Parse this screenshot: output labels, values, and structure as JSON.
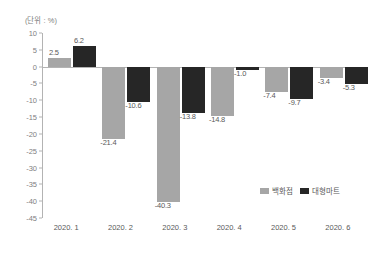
{
  "chart_data": {
    "type": "bar",
    "title": "",
    "subtitle": "",
    "unit_label": "(단위 : %)",
    "xlabel": "",
    "ylabel": "",
    "categories": [
      "2020. 1",
      "2020. 2",
      "2020. 3",
      "2020. 4",
      "2020. 5",
      "2020. 6"
    ],
    "series": [
      {
        "name": "백화점",
        "color": "#a6a6a6",
        "values": [
          2.5,
          -21.4,
          -40.3,
          -14.8,
          -7.4,
          -3.4
        ],
        "labels": [
          "2.5",
          "-21.4",
          "-40.3",
          "-14.8",
          "-7.4",
          "-3.4"
        ]
      },
      {
        "name": "대형마트",
        "color": "#262626",
        "values": [
          6.2,
          -10.6,
          -13.8,
          -1.0,
          -9.7,
          -5.3
        ],
        "labels": [
          "6.2",
          "-10.6",
          "-13.8",
          "-1.0",
          "-9.7",
          "-5.3"
        ]
      }
    ],
    "ylim": [
      -45,
      10
    ],
    "yticks": [
      10,
      5,
      0,
      -5,
      -10,
      -15,
      -20,
      -25,
      -30,
      -35,
      -40,
      -45
    ],
    "ytick_labels": [
      "10",
      "5",
      "0",
      "-5",
      "-10",
      "-15",
      "-20",
      "-25",
      "-30",
      "-35",
      "-40",
      "-45"
    ],
    "grid": false,
    "legend_position": "inside-bottom-right",
    "zero_line": true
  }
}
